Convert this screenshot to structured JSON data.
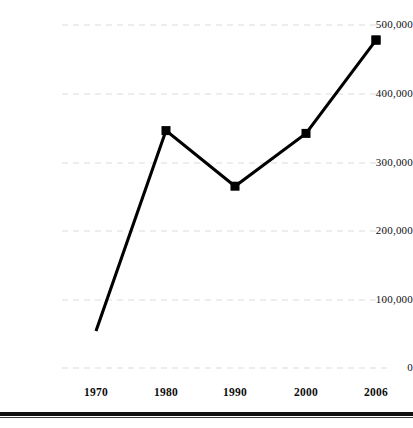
{
  "chart_data": {
    "type": "line",
    "title": "",
    "subtitle": "",
    "xlabel": "",
    "ylabel": "",
    "categories": [
      "1970",
      "1980",
      "1990",
      "2000",
      "2006"
    ],
    "values": [
      54000,
      346000,
      265000,
      342000,
      478000
    ],
    "series": [
      {
        "name": "",
        "values": [
          54000,
          346000,
          265000,
          342000,
          478000
        ]
      }
    ],
    "ylim": [
      0,
      500000
    ],
    "y_ticks": [
      0,
      100000,
      200000,
      300000,
      400000,
      500000
    ],
    "y_tick_labels": [
      "0",
      "100,000",
      "200,000",
      "300,000",
      "400,000",
      "500,000"
    ],
    "x_tick_labels": [
      "1970",
      "1980",
      "1990",
      "2000",
      "2006"
    ],
    "grid": true,
    "grid_axis": "y",
    "grid_style": "dashed",
    "legend": false,
    "legend_position": "none",
    "marker": "square",
    "line_color": "#000000",
    "marker_color": "#000000",
    "grid_color": "#e8e8e8",
    "background_color": "#ffffff"
  },
  "axes": {
    "y_labels": [
      "500,000",
      "400,000",
      "300,000",
      "200,000",
      "100,000",
      "0"
    ],
    "x_labels": [
      "1970",
      "1980",
      "1990",
      "2000",
      "2006"
    ]
  },
  "footer": {
    "rule_color": "#111111"
  }
}
